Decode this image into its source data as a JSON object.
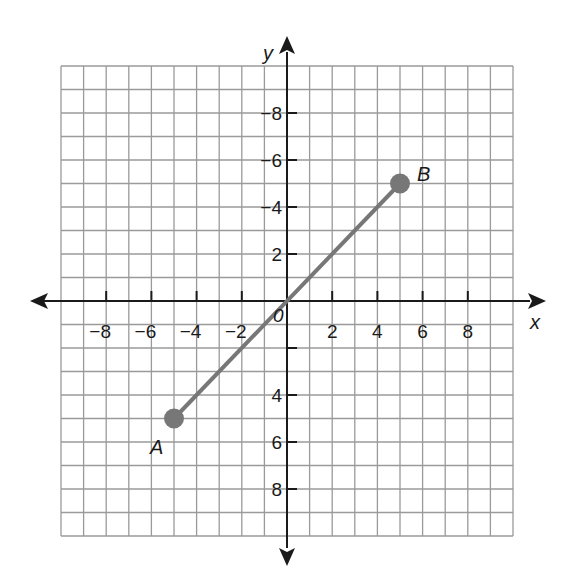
{
  "chart_data": {
    "type": "line",
    "title": "",
    "xlabel": "x",
    "ylabel": "y",
    "xlim": [
      -10,
      10
    ],
    "ylim": [
      -10,
      10
    ],
    "grid": true,
    "grid_step": 1,
    "x_ticks": [
      -8,
      -6,
      -4,
      -2,
      2,
      4,
      6,
      8
    ],
    "y_ticks": [
      -8,
      -6,
      -4,
      2,
      4,
      6,
      8
    ],
    "y_tick_marks": [
      -8,
      -6,
      -4,
      -2,
      2,
      4,
      6,
      8
    ],
    "origin_label": "0",
    "x_tick_labels": [
      "−8",
      "−6",
      "−4",
      "−2",
      "2",
      "4",
      "6",
      "8"
    ],
    "y_tick_labels": [
      "8",
      "6",
      "4",
      "2",
      "−4",
      "−6",
      "−8"
    ],
    "series": [
      {
        "name": "segment AB",
        "points": [
          {
            "label": "A",
            "x": -5,
            "y": -5
          },
          {
            "label": "B",
            "x": 5,
            "y": 5
          }
        ]
      }
    ],
    "colors": {
      "grid": "#9a9a9a",
      "axis": "#1a1a1a",
      "segment": "#777777",
      "points": "#777777"
    }
  }
}
